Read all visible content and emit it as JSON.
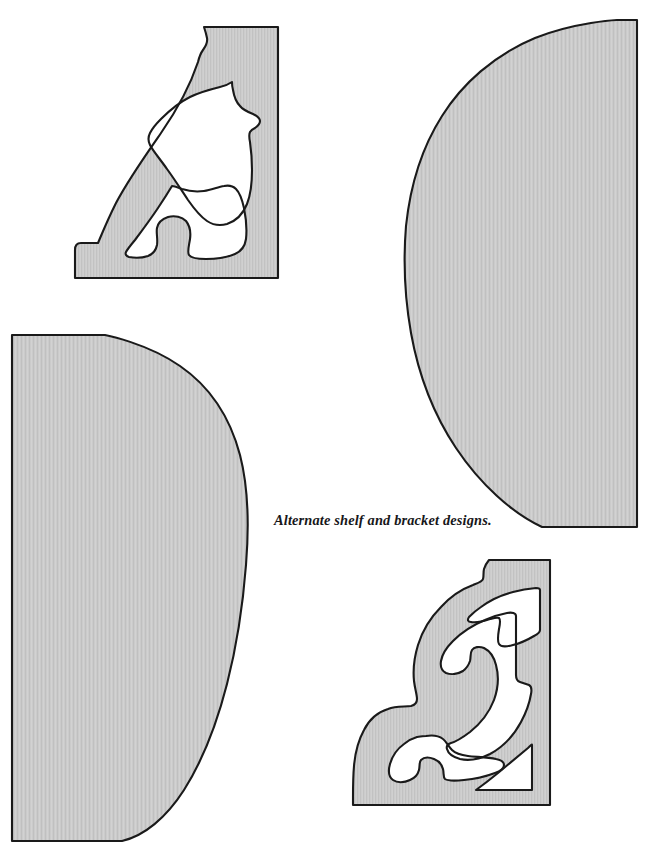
{
  "page": {
    "background_color": "#ffffff",
    "width": 651,
    "height": 857,
    "title": "Alternate shelf and bracket designs"
  },
  "caption": {
    "text": "Alternate shelf and bracket designs.",
    "style": "italic serif",
    "color": "#17171a",
    "x": 274,
    "y": 513
  },
  "style": {
    "fill_color": "#c9c9c9",
    "fill_color_light": "#d2d2d2",
    "outline_color": "#1a1a1a",
    "outline_width": 2.1,
    "texture": "fine vertical woodgrain hatching"
  },
  "figures": [
    {
      "id": "bracket-top-left",
      "name": "scrolled corner bracket (upper left)",
      "type": "pierced bracket",
      "cutouts": 2,
      "bounds": {
        "x": 75,
        "y": 27,
        "width": 204,
        "height": 252
      }
    },
    {
      "id": "shelf-right",
      "name": "half-ellipse shelf (right)",
      "type": "solid shelf",
      "cutouts": 0,
      "bounds": {
        "x": 405,
        "y": 20,
        "width": 232,
        "height": 508
      }
    },
    {
      "id": "shelf-left",
      "name": "rounded D shelf (left)",
      "type": "solid shelf",
      "cutouts": 0,
      "bounds": {
        "x": 11,
        "y": 334,
        "width": 235,
        "height": 508
      }
    },
    {
      "id": "bracket-bottom-right",
      "name": "ornate S-scroll corner bracket (lower right)",
      "type": "pierced bracket",
      "cutouts": 4,
      "bounds": {
        "x": 353,
        "y": 560,
        "width": 197,
        "height": 245
      }
    }
  ]
}
